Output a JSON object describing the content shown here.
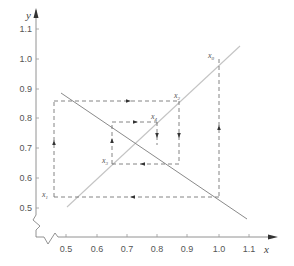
{
  "diagram": {
    "type": "cobweb",
    "axes": {
      "x": {
        "label": "x",
        "ticks": [
          "0.5",
          "0.6",
          "0.7",
          "0.8",
          "0.9",
          "1.0",
          "1.1"
        ],
        "tick_values": [
          0.5,
          0.6,
          0.7,
          0.8,
          0.9,
          1.0,
          1.1
        ]
      },
      "y": {
        "label": "y",
        "ticks": [
          "0.5",
          "0.6",
          "0.7",
          "0.8",
          "0.9",
          "1.0",
          "1.1"
        ],
        "tick_values": [
          0.5,
          0.6,
          0.7,
          0.8,
          0.9,
          1.0,
          1.1
        ]
      },
      "broken_axes": true
    },
    "lines": [
      {
        "name": "diagonal",
        "equation": "y = x",
        "from": [
          0.5,
          0.5
        ],
        "to": [
          1.09,
          1.09
        ],
        "color": "#bdbdbd"
      },
      {
        "name": "decreasing-map",
        "from": [
          0.47,
          0.88
        ],
        "to": [
          1.08,
          0.46
        ],
        "color": "#8a8a8a"
      }
    ],
    "points": [
      {
        "label": "x",
        "sub": "0",
        "x": 1.0,
        "y": 1.0
      },
      {
        "label": "x",
        "sub": "1",
        "x": 0.54,
        "y": 0.54
      },
      {
        "label": "x",
        "sub": "2",
        "x": 0.86,
        "y": 0.86
      },
      {
        "label": "x",
        "sub": "3",
        "x": 0.65,
        "y": 0.65
      },
      {
        "label": "x",
        "sub": "4",
        "x": 0.79,
        "y": 0.79
      }
    ],
    "path_style": {
      "dash": "4,3",
      "color": "#666666"
    }
  }
}
